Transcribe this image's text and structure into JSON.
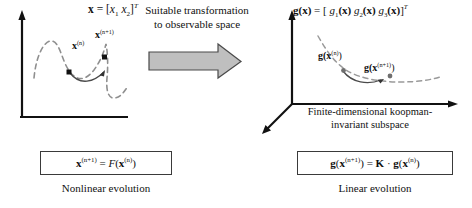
{
  "figure": {
    "left_panel": {
      "state_formula_parts": {
        "lhs": "x",
        "eq": "=",
        "open": "[",
        "x1": "x",
        "x1sub": "1",
        "x2": "x",
        "x2sub": "2",
        "close": "]",
        "transpose": "T"
      },
      "point_labels": [
        {
          "base": "x",
          "sup": "(n)"
        },
        {
          "base": "x",
          "sup": "(n+1)"
        }
      ],
      "axis_style": "2d-L-axes",
      "trajectory_style": "dashed-wavy-curve",
      "segment_style": "solid-arrow-arc"
    },
    "middle": {
      "caption_line1": "Suitable transformation",
      "caption_line2": "to observable space",
      "arrow_name": "block-arrow-right",
      "arrow_fill": "#bfbfbf",
      "arrow_stroke": "#4a4a4a"
    },
    "right_panel": {
      "observable_formula_parts": {
        "lhs_bold": "g",
        "lhs_arg": "(x)",
        "eq": "=",
        "open": "[",
        "g1": "g",
        "g1sub": "1",
        "g1arg": "(x)",
        "g2": "g",
        "g2sub": "2",
        "g2arg": "(x)",
        "g3": "g",
        "g3sub": "3",
        "g3arg": "(x)",
        "close": "]",
        "transpose": "T"
      },
      "point_labels": [
        {
          "base": "g(x",
          "sup": "(n)",
          "tail": ")"
        },
        {
          "base": "g(x",
          "sup": "(n+1)",
          "tail": ")"
        }
      ],
      "axis_style": "3d-axes",
      "subspace_caption_line1": "Finite-dimensional koopman-",
      "subspace_caption_line2": "invariant subspace"
    },
    "bottom": {
      "nonlinear_equation": {
        "lhs_bold": "x",
        "lhs_sup": "(n+1)",
        "eq": "=",
        "func": "F",
        "arg_open": "(",
        "arg_bold": "x",
        "arg_sup": "(n)",
        "arg_close": ")"
      },
      "nonlinear_caption": "Nonlinear evolution",
      "linear_equation": {
        "lhs_bold": "g",
        "lhs_open": "(",
        "lhs_x": "x",
        "lhs_sup": "(n+1)",
        "lhs_close": ")",
        "eq": "=",
        "operator_bold": "K",
        "dot": "·",
        "rhs_bold": "g",
        "rhs_open": "(",
        "rhs_x": "x",
        "rhs_sup": "(n)",
        "rhs_close": ")"
      },
      "linear_caption": "Linear evolution"
    }
  },
  "colors": {
    "ink": "#111111",
    "axis": "#111111",
    "dashed_curve": "#8c8c8c",
    "arrow_fill": "#bfbfbf",
    "arrow_stroke": "#4a4a4a",
    "box_border": "#3a3a3a",
    "background": "#ffffff"
  }
}
